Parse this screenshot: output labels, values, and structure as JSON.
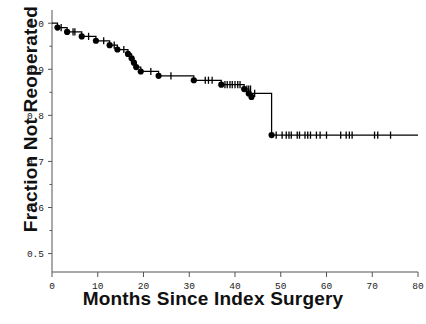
{
  "chart_data": {
    "type": "line",
    "subtype": "kaplan-meier-step",
    "title": "",
    "xlabel": "Months Since Index Surgery",
    "ylabel": "Fraction Not Reoperated",
    "xlim": [
      0,
      80
    ],
    "ylim": [
      0.46,
      1.02
    ],
    "grid": false,
    "legend": null,
    "xticks": [
      0,
      10,
      20,
      30,
      40,
      50,
      60,
      70,
      80
    ],
    "xtick_labels": [
      "0",
      "10",
      "20",
      "30",
      "40",
      "50",
      "60",
      "70",
      "80"
    ],
    "yticks": [
      0.5,
      0.6,
      0.7,
      0.8,
      0.9,
      1.0
    ],
    "ytick_labels": [
      "0.5",
      "0.6",
      "0.7",
      "0.8",
      "0.9",
      "1.0"
    ],
    "series": [
      {
        "name": "Fraction Not Reoperated",
        "style": "step-post",
        "color": "#000000",
        "x": [
          0,
          1.2,
          3.3,
          6.5,
          9.6,
          12.6,
          14.3,
          16.6,
          17.4,
          17.9,
          18.4,
          19.4,
          23.3,
          28.3,
          31.0,
          37.0,
          40.0,
          42.0,
          43.0,
          48.0,
          80.0
        ],
        "y": [
          1.0,
          0.9905,
          0.981,
          0.9714,
          0.9619,
          0.9524,
          0.9429,
          0.9333,
          0.9238,
          0.9143,
          0.9048,
          0.8952,
          0.8857,
          0.8857,
          0.8762,
          0.8667,
          0.8667,
          0.8571,
          0.8476,
          0.7571,
          0.7571
        ]
      }
    ],
    "event_points": [
      {
        "x": 1.2,
        "y": 0.9905
      },
      {
        "x": 3.3,
        "y": 0.981
      },
      {
        "x": 6.5,
        "y": 0.9714
      },
      {
        "x": 9.6,
        "y": 0.9619
      },
      {
        "x": 12.6,
        "y": 0.9524
      },
      {
        "x": 14.3,
        "y": 0.9429
      },
      {
        "x": 16.6,
        "y": 0.9333
      },
      {
        "x": 17.4,
        "y": 0.9238
      },
      {
        "x": 17.9,
        "y": 0.9143
      },
      {
        "x": 18.4,
        "y": 0.9048
      },
      {
        "x": 19.4,
        "y": 0.8952
      },
      {
        "x": 23.3,
        "y": 0.8857
      },
      {
        "x": 31.0,
        "y": 0.8762
      },
      {
        "x": 37.0,
        "y": 0.8667
      },
      {
        "x": 42.0,
        "y": 0.8571
      },
      {
        "x": 43.0,
        "y": 0.8476
      },
      {
        "x": 43.6,
        "y": 0.84
      },
      {
        "x": 48.0,
        "y": 0.7571
      }
    ],
    "censored_marks": [
      {
        "x": 2.0,
        "y": 0.9905
      },
      {
        "x": 4.6,
        "y": 0.981
      },
      {
        "x": 5.0,
        "y": 0.981
      },
      {
        "x": 8.0,
        "y": 0.9714
      },
      {
        "x": 11.3,
        "y": 0.9619
      },
      {
        "x": 13.6,
        "y": 0.9524
      },
      {
        "x": 15.7,
        "y": 0.9429
      },
      {
        "x": 21.6,
        "y": 0.8952
      },
      {
        "x": 26.0,
        "y": 0.8857
      },
      {
        "x": 33.5,
        "y": 0.8762
      },
      {
        "x": 34.2,
        "y": 0.8762
      },
      {
        "x": 35.0,
        "y": 0.8762
      },
      {
        "x": 37.8,
        "y": 0.8667
      },
      {
        "x": 38.3,
        "y": 0.8667
      },
      {
        "x": 38.9,
        "y": 0.8667
      },
      {
        "x": 39.4,
        "y": 0.8667
      },
      {
        "x": 40.0,
        "y": 0.8667
      },
      {
        "x": 40.6,
        "y": 0.8667
      },
      {
        "x": 41.1,
        "y": 0.8667
      },
      {
        "x": 42.6,
        "y": 0.8571
      },
      {
        "x": 43.0,
        "y": 0.8571
      },
      {
        "x": 43.4,
        "y": 0.8571
      },
      {
        "x": 44.3,
        "y": 0.8476
      },
      {
        "x": 49.0,
        "y": 0.7571
      },
      {
        "x": 50.3,
        "y": 0.7571
      },
      {
        "x": 51.2,
        "y": 0.7571
      },
      {
        "x": 51.8,
        "y": 0.7571
      },
      {
        "x": 52.3,
        "y": 0.7571
      },
      {
        "x": 53.6,
        "y": 0.7571
      },
      {
        "x": 54.1,
        "y": 0.7571
      },
      {
        "x": 55.3,
        "y": 0.7571
      },
      {
        "x": 55.9,
        "y": 0.7571
      },
      {
        "x": 56.5,
        "y": 0.7571
      },
      {
        "x": 57.8,
        "y": 0.7571
      },
      {
        "x": 58.6,
        "y": 0.7571
      },
      {
        "x": 60.0,
        "y": 0.7571
      },
      {
        "x": 63.1,
        "y": 0.7571
      },
      {
        "x": 64.3,
        "y": 0.7571
      },
      {
        "x": 65.0,
        "y": 0.7571
      },
      {
        "x": 65.6,
        "y": 0.7571
      },
      {
        "x": 70.5,
        "y": 0.7571
      },
      {
        "x": 71.2,
        "y": 0.7571
      },
      {
        "x": 74.0,
        "y": 0.7571
      }
    ]
  },
  "axes": {
    "x_label": "Months Since Index Surgery",
    "y_label": "Fraction Not Reoperated",
    "axis_color": "#555555",
    "curve_color": "#000000"
  },
  "caption": {
    "partial_text": ""
  }
}
